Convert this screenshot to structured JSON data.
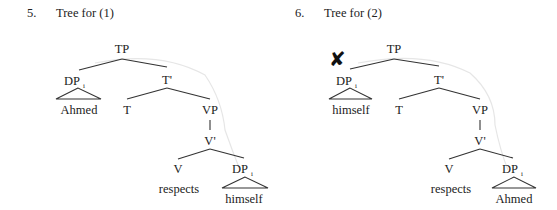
{
  "figures": [
    {
      "number": "5.",
      "caption": "Tree for (1)",
      "grammatical": true,
      "nodes": {
        "root": "TP",
        "subject_dp": "DP",
        "subject_index": "i",
        "subject_word": "Ahmed",
        "tbar": "T'",
        "t": "T",
        "vp": "VP",
        "vbar": "V'",
        "v": "V",
        "verb_word": "respects",
        "object_dp": "DP",
        "object_index": "i",
        "object_word": "himself"
      }
    },
    {
      "number": "6.",
      "caption": "Tree for (2)",
      "grammatical": false,
      "ungrammatical_mark": "✘",
      "nodes": {
        "root": "TP",
        "subject_dp": "DP",
        "subject_index": "i",
        "subject_word": "himself",
        "tbar": "T'",
        "t": "T",
        "vp": "VP",
        "vbar": "V'",
        "v": "V",
        "verb_word": "respects",
        "object_dp": "DP",
        "object_index": "i",
        "object_word": "Ahmed"
      }
    }
  ]
}
